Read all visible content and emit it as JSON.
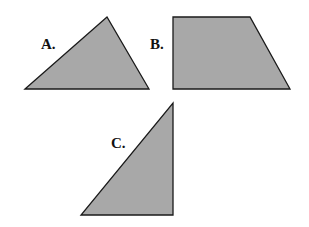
{
  "diagram": {
    "style": {
      "fill": "#a8a8a8",
      "stroke": "#1a1a1a",
      "background": "#ffffff"
    },
    "shapes": [
      {
        "id": "A",
        "label": "A.",
        "type": "triangle",
        "description": "scalene triangle",
        "points": "25,89 107,17 149,89",
        "label_pos": {
          "x": 41,
          "y": 37
        }
      },
      {
        "id": "B",
        "label": "B.",
        "type": "trapezoid",
        "description": "right trapezoid",
        "points": "173,17 250,17 290,89 173,89",
        "label_pos": {
          "x": 150,
          "y": 37
        }
      },
      {
        "id": "C",
        "label": "C.",
        "type": "triangle",
        "description": "right triangle",
        "points": "173,103 173,215 81,215",
        "label_pos": {
          "x": 111,
          "y": 136
        }
      }
    ]
  }
}
